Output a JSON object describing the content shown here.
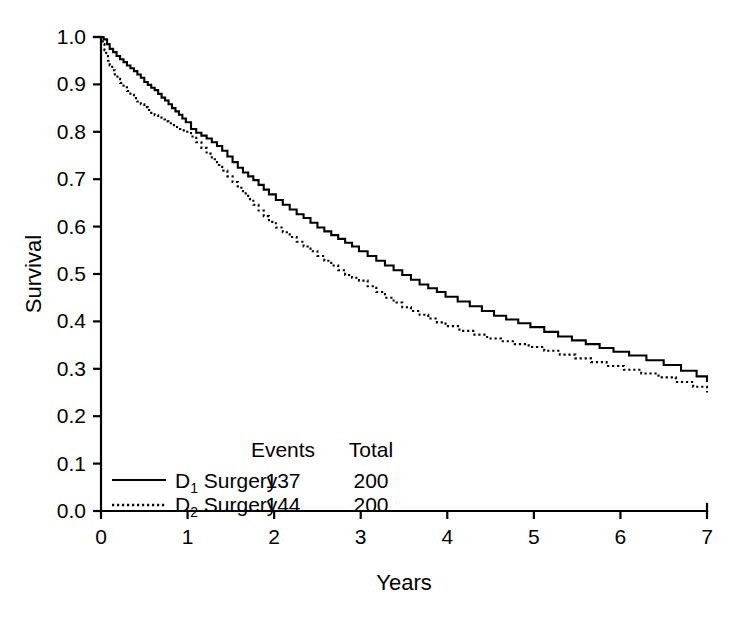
{
  "chart_data": {
    "type": "line",
    "title": "",
    "xlabel": "Years",
    "ylabel": "Survival",
    "xlim": [
      0,
      7
    ],
    "ylim": [
      0.0,
      1.0
    ],
    "grid": false,
    "legend_position": "bottom-left",
    "x_ticks": [
      "0",
      "1",
      "2",
      "3",
      "4",
      "5",
      "6",
      "7"
    ],
    "y_ticks": [
      "0.0",
      "0.1",
      "0.2",
      "0.3",
      "0.4",
      "0.5",
      "0.6",
      "0.7",
      "0.8",
      "0.9",
      "1.0"
    ],
    "series": [
      {
        "name": "D1 Surgery",
        "label_main": "D",
        "label_sub": "1",
        "label_rest": " Surgery",
        "style": "solid",
        "events": "137",
        "total": "200",
        "x": [
          0.0,
          0.03,
          0.07,
          0.1,
          0.14,
          0.18,
          0.22,
          0.26,
          0.3,
          0.34,
          0.38,
          0.42,
          0.46,
          0.5,
          0.54,
          0.58,
          0.62,
          0.66,
          0.7,
          0.74,
          0.78,
          0.82,
          0.86,
          0.9,
          0.94,
          0.98,
          1.04,
          1.1,
          1.16,
          1.22,
          1.28,
          1.34,
          1.4,
          1.46,
          1.52,
          1.58,
          1.64,
          1.7,
          1.76,
          1.82,
          1.88,
          1.94,
          2.02,
          2.1,
          2.18,
          2.26,
          2.34,
          2.42,
          2.5,
          2.58,
          2.66,
          2.74,
          2.82,
          2.9,
          2.98,
          3.08,
          3.18,
          3.28,
          3.38,
          3.48,
          3.58,
          3.68,
          3.78,
          3.88,
          3.98,
          4.12,
          4.26,
          4.4,
          4.54,
          4.68,
          4.82,
          4.96,
          5.12,
          5.28,
          5.44,
          5.6,
          5.76,
          5.92,
          6.1,
          6.3,
          6.5,
          6.7,
          6.88,
          7.0
        ],
        "y": [
          1.0,
          0.995,
          0.985,
          0.975,
          0.968,
          0.96,
          0.953,
          0.947,
          0.94,
          0.934,
          0.928,
          0.921,
          0.914,
          0.905,
          0.899,
          0.893,
          0.888,
          0.88,
          0.872,
          0.866,
          0.858,
          0.85,
          0.843,
          0.836,
          0.828,
          0.82,
          0.806,
          0.798,
          0.792,
          0.786,
          0.778,
          0.77,
          0.76,
          0.748,
          0.736,
          0.724,
          0.714,
          0.706,
          0.698,
          0.688,
          0.678,
          0.668,
          0.656,
          0.646,
          0.636,
          0.626,
          0.618,
          0.608,
          0.598,
          0.59,
          0.582,
          0.574,
          0.566,
          0.558,
          0.548,
          0.538,
          0.528,
          0.518,
          0.508,
          0.498,
          0.488,
          0.478,
          0.47,
          0.462,
          0.452,
          0.442,
          0.432,
          0.422,
          0.412,
          0.404,
          0.396,
          0.388,
          0.378,
          0.368,
          0.36,
          0.352,
          0.344,
          0.336,
          0.328,
          0.318,
          0.308,
          0.296,
          0.284,
          0.272
        ]
      },
      {
        "name": "D2 Surgery",
        "label_main": "D",
        "label_sub": "2",
        "label_rest": " Surgery",
        "style": "dotted",
        "events": "144",
        "total": "200",
        "x": [
          0.0,
          0.02,
          0.04,
          0.06,
          0.08,
          0.1,
          0.13,
          0.16,
          0.19,
          0.22,
          0.26,
          0.3,
          0.34,
          0.38,
          0.42,
          0.46,
          0.5,
          0.54,
          0.58,
          0.62,
          0.66,
          0.7,
          0.74,
          0.78,
          0.82,
          0.86,
          0.9,
          0.94,
          0.98,
          1.04,
          1.1,
          1.16,
          1.22,
          1.28,
          1.34,
          1.4,
          1.46,
          1.52,
          1.58,
          1.64,
          1.7,
          1.76,
          1.82,
          1.88,
          1.94,
          2.02,
          2.1,
          2.18,
          2.26,
          2.34,
          2.42,
          2.5,
          2.58,
          2.66,
          2.74,
          2.82,
          2.9,
          2.98,
          3.08,
          3.18,
          3.28,
          3.38,
          3.48,
          3.58,
          3.68,
          3.78,
          3.88,
          3.98,
          4.14,
          4.3,
          4.46,
          4.62,
          4.78,
          4.94,
          5.12,
          5.3,
          5.48,
          5.66,
          5.84,
          6.04,
          6.24,
          6.44,
          6.64,
          6.84,
          7.0
        ],
        "y": [
          1.0,
          0.985,
          0.972,
          0.96,
          0.95,
          0.94,
          0.93,
          0.921,
          0.912,
          0.903,
          0.894,
          0.886,
          0.878,
          0.871,
          0.864,
          0.858,
          0.852,
          0.846,
          0.84,
          0.835,
          0.83,
          0.826,
          0.822,
          0.818,
          0.814,
          0.81,
          0.806,
          0.803,
          0.8,
          0.79,
          0.778,
          0.766,
          0.754,
          0.742,
          0.73,
          0.718,
          0.706,
          0.694,
          0.682,
          0.67,
          0.658,
          0.646,
          0.634,
          0.622,
          0.61,
          0.598,
          0.588,
          0.578,
          0.568,
          0.558,
          0.548,
          0.538,
          0.528,
          0.518,
          0.508,
          0.498,
          0.492,
          0.486,
          0.474,
          0.462,
          0.45,
          0.44,
          0.43,
          0.422,
          0.414,
          0.406,
          0.398,
          0.39,
          0.38,
          0.372,
          0.364,
          0.358,
          0.352,
          0.346,
          0.338,
          0.33,
          0.322,
          0.314,
          0.306,
          0.298,
          0.29,
          0.282,
          0.272,
          0.262,
          0.25
        ]
      }
    ],
    "legend": {
      "header_events": "Events",
      "header_total": "Total"
    }
  }
}
